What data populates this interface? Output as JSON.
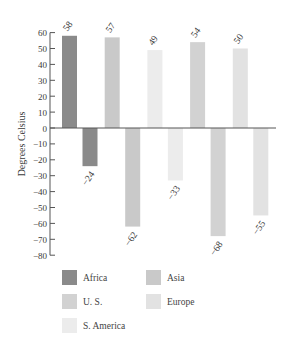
{
  "chart_data": {
    "type": "bar",
    "title": "",
    "xlabel": "",
    "ylabel": "Degrees Celsius",
    "ylim": [
      -80,
      60
    ],
    "yticks": [
      60,
      50,
      40,
      30,
      20,
      10,
      0,
      -10,
      -20,
      -30,
      -40,
      -50,
      -60,
      -70,
      -80
    ],
    "grid": false,
    "legend_position": "bottom",
    "categories": [
      "Africa",
      "Asia",
      "S. America",
      "U. S.",
      "Europe"
    ],
    "series": [
      {
        "name": "High",
        "values": [
          58,
          57,
          49,
          54,
          50
        ]
      },
      {
        "name": "Low",
        "values": [
          -24,
          -62,
          -33,
          -68,
          -55
        ]
      }
    ],
    "bar_labels": {
      "high": [
        "58",
        "57",
        "49",
        "54",
        "50"
      ],
      "low": [
        "-24",
        "-62",
        "-33",
        "-68",
        "-55"
      ]
    },
    "colors": {
      "Africa": "#8a8a8a",
      "Asia": "#c9c9c9",
      "S. America": "#ececec",
      "U. S.": "#d2d2d2",
      "Europe": "#e2e2e2"
    }
  },
  "legend": {
    "items": [
      {
        "label": "Africa",
        "color": "#8a8a8a"
      },
      {
        "label": "Asia",
        "color": "#c9c9c9"
      },
      {
        "label": "U. S.",
        "color": "#d2d2d2"
      },
      {
        "label": "Europe",
        "color": "#e2e2e2"
      },
      {
        "label": "S. America",
        "color": "#ececec"
      }
    ]
  }
}
